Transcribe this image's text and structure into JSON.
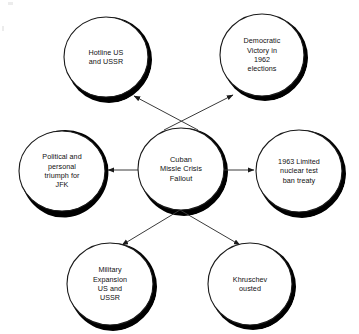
{
  "diagram": {
    "type": "concept-map",
    "title": "Cuban Missle Crisis Fallout",
    "background_color": "#ffffff",
    "stroke_color": "#1a1a1a",
    "shadow_color": "#000000",
    "text_color": "#111111",
    "central_node": {
      "id": "central",
      "label": "Cuban\nMissle Crisis\nFallout",
      "cx": 181,
      "cy": 169,
      "rx": 43,
      "ry": 41
    },
    "nodes": [
      {
        "id": "hotline",
        "label": "Hotline US\nand USSR",
        "cx": 106,
        "cy": 57,
        "rx": 42,
        "ry": 40
      },
      {
        "id": "democratic-victory",
        "label": "Democratic\nVictory in\n1962\nelections",
        "cx": 262,
        "cy": 55,
        "rx": 42,
        "ry": 41
      },
      {
        "id": "jfk-triumph",
        "label": "Political and\npersonal\ntriumph for\nJFK",
        "cx": 62,
        "cy": 171,
        "rx": 43,
        "ry": 40
      },
      {
        "id": "test-ban-treaty",
        "label": "1963 Limited\nnuclear test\nban treaty",
        "cx": 299,
        "cy": 171,
        "rx": 43,
        "ry": 41
      },
      {
        "id": "military-expansion",
        "label": "Military\nExpansion\nUS and\nUSSR",
        "cx": 110,
        "cy": 284,
        "rx": 43,
        "ry": 41
      },
      {
        "id": "khruschev-ousted",
        "label": "Khruschev\nousted",
        "cx": 250,
        "cy": 284,
        "rx": 42,
        "ry": 41
      }
    ],
    "edges": [
      {
        "id": "edge-to-hotline",
        "from": "central",
        "to": "hotline",
        "x1": 198,
        "y1": 130,
        "x2": 134,
        "y2": 96
      },
      {
        "id": "edge-to-democratic-victory",
        "from": "central",
        "to": "democratic-victory",
        "x1": 164,
        "y1": 130,
        "x2": 233,
        "y2": 95
      },
      {
        "id": "edge-to-jfk-triumph",
        "from": "central",
        "to": "jfk-triumph",
        "x1": 138,
        "y1": 170,
        "x2": 108,
        "y2": 170
      },
      {
        "id": "edge-to-test-ban-treaty",
        "from": "central",
        "to": "test-ban-treaty",
        "x1": 224,
        "y1": 170,
        "x2": 254,
        "y2": 170
      },
      {
        "id": "edge-to-military-expansion",
        "from": "central",
        "to": "military-expansion",
        "x1": 180,
        "y1": 210,
        "x2": 122,
        "y2": 245
      },
      {
        "id": "edge-to-khruschev-ousted",
        "from": "central",
        "to": "khruschev-ousted",
        "x1": 180,
        "y1": 210,
        "x2": 240,
        "y2": 245
      }
    ]
  }
}
